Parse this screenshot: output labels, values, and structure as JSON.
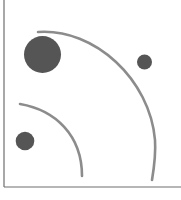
{
  "figure": {
    "colors": {
      "background": "#ffffff",
      "axis": "#6e6e6e",
      "arc": "#8c8c8c",
      "circle": "#555555"
    },
    "axes": {
      "origin": [
        4,
        187
      ],
      "y_top": 0,
      "x_right": 181
    },
    "arcs": [
      {
        "name": "outer-arc",
        "path": "M 38 32 C 95 28 150 80 155 140 C 156 155 154 168 152 180"
      },
      {
        "name": "inner-arc",
        "path": "M 20 104 C 55 110 82 135 82 176"
      }
    ],
    "circles": [
      {
        "name": "large-circle",
        "cx": 42.5,
        "cy": 54.5,
        "r": 18.5
      },
      {
        "name": "small-circle-right",
        "cx": 144.5,
        "cy": 62,
        "r": 7.5
      },
      {
        "name": "medium-circle-bottom-left",
        "cx": 25,
        "cy": 141,
        "r": 9.3
      }
    ]
  }
}
